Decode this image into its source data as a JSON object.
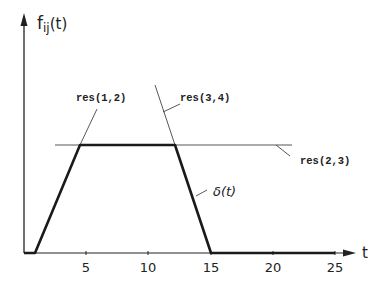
{
  "diagram": {
    "y_axis_label_main": "f",
    "y_axis_label_sub": "ij",
    "y_axis_label_arg": "(t)",
    "x_axis_label": "t",
    "x_ticks": [
      "5",
      "10",
      "15",
      "20",
      "25"
    ],
    "labels": {
      "res12": "res(1,2)",
      "res34": "res(3,4)",
      "res23": "res(2,3)",
      "delta": "δ(t)"
    },
    "function_points_t": [
      [
        0,
        0
      ],
      [
        1,
        0
      ],
      [
        4.5,
        1
      ],
      [
        12.2,
        1
      ],
      [
        15,
        0
      ],
      [
        25,
        0
      ]
    ],
    "colors": {
      "line": "#222222",
      "background": "#ffffff"
    }
  }
}
